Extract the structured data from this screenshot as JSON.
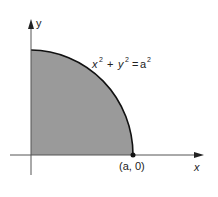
{
  "figure": {
    "curve_label": {
      "x": "x",
      "y": "y",
      "rhs": "a",
      "exp": "2",
      "plus": "+",
      "eq": "="
    },
    "point_label": "(a, 0)",
    "x_axis_label": "x",
    "y_axis_label": "y",
    "colors": {
      "fill": "#9a9a9a",
      "stroke": "#111111",
      "axis": "#555555"
    }
  }
}
